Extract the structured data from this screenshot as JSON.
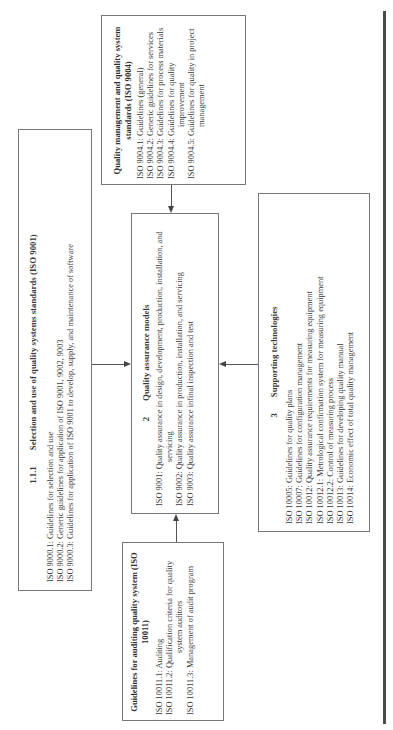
{
  "diagram": {
    "selection_box": {
      "section_number": "1.1.1",
      "title": "Selection and use of quality systems standards (ISO 9001)",
      "items": [
        {
          "code": "ISO 9000.1:",
          "text": "Guidelines for selection and use"
        },
        {
          "code": "ISO 9000.2:",
          "text": "Generic guidelines for application of ISO 9001, 9002, 9003"
        },
        {
          "code": "ISO 9000.3:",
          "text": "Guidelines for application of ISO 9001 to develop, supply, and maintenance of software"
        }
      ]
    },
    "iso9004_box": {
      "title": "Quality management and quality system standards (ISO 9004)",
      "items": [
        {
          "code": "ISO 9004.1:",
          "text": "Guidelines (general)"
        },
        {
          "code": "ISO 9004.2:",
          "text": "Generic guidelines for services"
        },
        {
          "code": "ISO 9004.3:",
          "text": "Guidelines for process materials"
        },
        {
          "code": "ISO 9004.4:",
          "text": "Guidelines for quality improvement"
        },
        {
          "code": "ISO 9004.5:",
          "text": "Guidelines for quality in project management"
        }
      ]
    },
    "qa_box": {
      "section_number": "2",
      "title": "Quality assurance models",
      "items": [
        {
          "code": "ISO 9001:",
          "text": "Quality assurance in design, development, production, installation, and servicing"
        },
        {
          "code": "ISO 9002:",
          "text": "Quality assurance in production, installation, and servicing"
        },
        {
          "code": "ISO 9003:",
          "text": "Quality assurance infinal inspection and test"
        }
      ]
    },
    "auditing_box": {
      "title": "Guidelines for auditing quality system (ISO 10011)",
      "items": [
        {
          "code": "ISO 10011.1:",
          "text": "Auditing"
        },
        {
          "code": "ISO 10011.2:",
          "text": "Qualification criteria for quality system auditors"
        },
        {
          "code": "ISO 10011.3:",
          "text": "Management of audit program"
        }
      ]
    },
    "supporting_box": {
      "section_number": "3",
      "title": "Supporting technologies",
      "items": [
        {
          "code": "ISO 10005:",
          "text": "Guidelines for quality plans"
        },
        {
          "code": "ISO 10007:",
          "text": "Guidelines for configuration management"
        },
        {
          "code": "ISO 10012:",
          "text": "Quality assurance requirements for measuring equipment"
        },
        {
          "code": "ISO 10012.1:",
          "text": "Metrological confirmation system for measuring equipment"
        },
        {
          "code": "ISO 10012.2:",
          "text": "Control of measuring process"
        },
        {
          "code": "ISO 10013:",
          "text": "Guidelines for developing quality manual"
        },
        {
          "code": "ISO 10014:",
          "text": "Economic effect of total quality management"
        }
      ]
    },
    "colors": {
      "border": "#777777",
      "text": "#3a3a3a",
      "rule": "#4a4a4a"
    }
  }
}
